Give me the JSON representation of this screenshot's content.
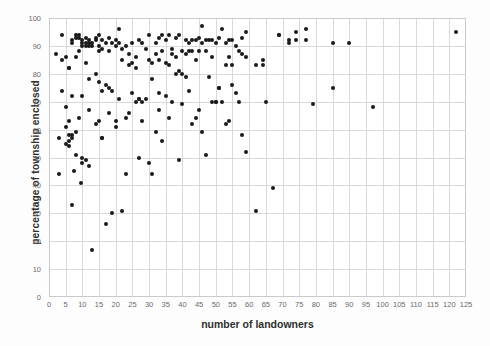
{
  "chart_data": {
    "type": "scatter",
    "title": "",
    "xlabel": "number of landowners",
    "ylabel": "percentage of township  enclosed",
    "xlim": [
      0,
      125
    ],
    "ylim": [
      0,
      100
    ],
    "xticks": [
      0,
      5,
      10,
      15,
      20,
      25,
      30,
      35,
      40,
      45,
      50,
      55,
      60,
      65,
      70,
      75,
      80,
      85,
      90,
      95,
      100,
      105,
      110,
      115,
      120,
      125
    ],
    "yticks": [
      0,
      10,
      20,
      30,
      40,
      50,
      60,
      70,
      80,
      90,
      100
    ],
    "grid": true,
    "legend": null,
    "marker": {
      "shape": "circle",
      "color": "#1a1a1a",
      "size": 4
    },
    "series": [
      {
        "name": "townships",
        "points": [
          [
            2,
            87
          ],
          [
            3,
            44
          ],
          [
            3,
            57
          ],
          [
            4,
            85
          ],
          [
            4,
            94
          ],
          [
            4,
            74
          ],
          [
            5,
            86
          ],
          [
            5,
            61
          ],
          [
            5,
            68
          ],
          [
            5,
            55
          ],
          [
            6,
            82
          ],
          [
            6,
            82
          ],
          [
            6,
            63
          ],
          [
            6,
            58
          ],
          [
            6,
            56
          ],
          [
            6,
            54
          ],
          [
            7,
            92
          ],
          [
            7,
            33
          ],
          [
            7,
            91
          ],
          [
            7,
            72
          ],
          [
            7,
            58
          ],
          [
            7,
            57
          ],
          [
            7.5,
            45
          ],
          [
            8,
            93
          ],
          [
            8,
            94
          ],
          [
            8,
            86
          ],
          [
            8,
            59
          ],
          [
            8,
            51
          ],
          [
            9,
            94
          ],
          [
            9,
            93
          ],
          [
            9,
            88
          ],
          [
            9,
            64
          ],
          [
            9.5,
            41
          ],
          [
            10,
            91
          ],
          [
            10,
            92
          ],
          [
            10,
            90
          ],
          [
            10,
            72
          ],
          [
            10,
            50
          ],
          [
            10,
            48
          ],
          [
            11,
            91
          ],
          [
            11,
            93
          ],
          [
            11,
            90
          ],
          [
            11,
            84
          ],
          [
            11,
            49
          ],
          [
            12,
            92
          ],
          [
            12,
            91
          ],
          [
            12,
            90
          ],
          [
            12,
            78
          ],
          [
            12,
            67
          ],
          [
            12,
            47
          ],
          [
            13,
            17
          ],
          [
            13,
            91
          ],
          [
            13,
            90
          ],
          [
            14,
            93
          ],
          [
            14,
            92
          ],
          [
            14,
            80
          ],
          [
            14,
            62
          ],
          [
            15,
            94
          ],
          [
            15,
            90
          ],
          [
            15,
            88
          ],
          [
            15,
            77
          ],
          [
            15,
            63
          ],
          [
            16,
            92
          ],
          [
            16,
            89
          ],
          [
            16,
            74
          ],
          [
            16,
            57
          ],
          [
            16,
            57
          ],
          [
            17,
            26
          ],
          [
            17,
            91
          ],
          [
            17,
            76
          ],
          [
            18,
            93
          ],
          [
            18,
            88
          ],
          [
            18,
            75
          ],
          [
            18,
            66
          ],
          [
            19,
            30
          ],
          [
            19,
            91
          ],
          [
            19,
            74
          ],
          [
            20,
            92
          ],
          [
            20,
            90
          ],
          [
            20,
            63
          ],
          [
            20,
            61
          ],
          [
            21,
            96
          ],
          [
            21,
            91
          ],
          [
            21,
            71
          ],
          [
            22,
            31
          ],
          [
            22,
            89
          ],
          [
            22,
            85
          ],
          [
            23,
            90
          ],
          [
            23,
            64
          ],
          [
            23,
            44
          ],
          [
            24,
            87
          ],
          [
            24,
            83
          ],
          [
            24,
            66
          ],
          [
            25,
            91
          ],
          [
            25,
            84
          ],
          [
            25,
            73
          ],
          [
            26,
            86
          ],
          [
            26,
            82
          ],
          [
            26,
            70
          ],
          [
            27,
            92
          ],
          [
            27,
            71
          ],
          [
            27,
            71
          ],
          [
            27,
            50
          ],
          [
            28,
            91
          ],
          [
            28,
            70
          ],
          [
            28,
            63
          ],
          [
            29,
            89
          ],
          [
            29,
            71
          ],
          [
            30,
            94
          ],
          [
            30,
            85
          ],
          [
            30,
            48
          ],
          [
            31,
            44
          ],
          [
            31,
            84
          ],
          [
            31,
            78
          ],
          [
            32,
            91
          ],
          [
            32,
            87
          ],
          [
            32,
            59
          ],
          [
            33,
            93
          ],
          [
            33,
            85
          ],
          [
            33,
            73
          ],
          [
            33,
            67
          ],
          [
            34,
            94
          ],
          [
            34,
            88
          ],
          [
            34,
            56
          ],
          [
            35,
            92
          ],
          [
            35,
            84
          ],
          [
            35,
            72
          ],
          [
            36,
            94
          ],
          [
            36,
            83
          ],
          [
            36,
            64
          ],
          [
            37,
            89
          ],
          [
            37,
            87
          ],
          [
            37,
            70
          ],
          [
            38,
            93
          ],
          [
            38,
            86
          ],
          [
            38,
            80
          ],
          [
            39,
            94
          ],
          [
            39,
            81
          ],
          [
            39,
            49
          ],
          [
            40,
            88
          ],
          [
            40,
            80
          ],
          [
            40,
            69
          ],
          [
            41,
            92
          ],
          [
            41,
            87
          ],
          [
            41,
            79
          ],
          [
            42,
            91
          ],
          [
            42,
            88
          ],
          [
            42,
            74
          ],
          [
            43,
            92
          ],
          [
            43,
            88
          ],
          [
            43,
            62
          ],
          [
            44,
            92
          ],
          [
            44,
            85
          ],
          [
            44,
            64
          ],
          [
            45,
            93
          ],
          [
            45,
            88
          ],
          [
            45,
            67
          ],
          [
            46,
            97
          ],
          [
            46,
            91
          ],
          [
            46,
            59
          ],
          [
            47,
            92
          ],
          [
            47,
            88
          ],
          [
            47,
            51
          ],
          [
            48,
            92
          ],
          [
            48,
            79
          ],
          [
            49,
            92
          ],
          [
            49,
            86
          ],
          [
            49,
            70
          ],
          [
            50,
            91
          ],
          [
            50,
            70
          ],
          [
            50,
            70
          ],
          [
            51,
            93
          ],
          [
            51,
            75
          ],
          [
            51,
            75
          ],
          [
            52,
            96
          ],
          [
            52,
            70
          ],
          [
            53,
            91
          ],
          [
            53,
            83
          ],
          [
            53,
            62
          ],
          [
            54,
            92
          ],
          [
            54,
            86
          ],
          [
            54,
            63
          ],
          [
            55,
            92
          ],
          [
            55,
            83
          ],
          [
            55,
            76
          ],
          [
            56,
            90
          ],
          [
            56,
            73
          ],
          [
            57,
            88
          ],
          [
            57,
            70
          ],
          [
            58,
            93
          ],
          [
            58,
            87
          ],
          [
            58,
            58
          ],
          [
            59,
            95
          ],
          [
            59,
            86
          ],
          [
            59,
            52
          ],
          [
            62,
            31
          ],
          [
            62,
            83
          ],
          [
            64,
            85
          ],
          [
            64,
            83
          ],
          [
            65,
            70
          ],
          [
            67,
            39
          ],
          [
            69,
            94
          ],
          [
            69,
            94
          ],
          [
            72,
            92
          ],
          [
            72,
            91
          ],
          [
            74,
            95
          ],
          [
            74,
            92
          ],
          [
            77,
            96
          ],
          [
            77,
            92
          ],
          [
            79,
            69
          ],
          [
            85,
            91
          ],
          [
            85,
            75
          ],
          [
            90,
            91
          ],
          [
            97,
            68
          ],
          [
            122,
            95
          ]
        ]
      }
    ]
  },
  "axis": {
    "x_tick_labels": [
      "0",
      "5",
      "10",
      "15",
      "20",
      "25",
      "30",
      "35",
      "40",
      "45",
      "50",
      "55",
      "60",
      "65",
      "70",
      "75",
      "80",
      "85",
      "90",
      "95",
      "100",
      "105",
      "110",
      "115",
      "120",
      "125"
    ],
    "y_tick_labels": [
      "0",
      "10",
      "20",
      "30",
      "40",
      "50",
      "60",
      "70",
      "80",
      "90",
      "100"
    ]
  }
}
